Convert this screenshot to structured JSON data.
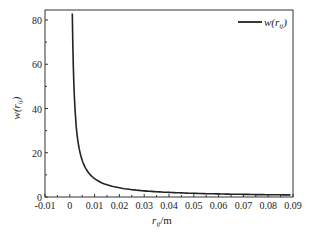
{
  "chart_data": {
    "type": "line",
    "title": "",
    "xlabel": "r_ij/m",
    "ylabel": "w(r_ij)",
    "xlim": [
      -0.01,
      0.09
    ],
    "ylim": [
      0,
      85
    ],
    "xticks": [
      "-0.01",
      "0",
      "0.01",
      "0.02",
      "0.03",
      "0.04",
      "0.05",
      "0.06",
      "0.07",
      "0.08",
      "0.09"
    ],
    "yticks": [
      "0",
      "20",
      "40",
      "60",
      "80"
    ],
    "grid": false,
    "legend_position": "upper right",
    "series": [
      {
        "name": "w(r_ij)",
        "color": "#222222",
        "x": [
          0.001,
          0.0015,
          0.002,
          0.003,
          0.004,
          0.005,
          0.006,
          0.008,
          0.01,
          0.015,
          0.02,
          0.03,
          0.04,
          0.05,
          0.06,
          0.07,
          0.08,
          0.09
        ],
        "y": [
          83,
          55.3,
          41.5,
          27.7,
          20.8,
          16.6,
          13.8,
          10.4,
          8.3,
          5.5,
          4.2,
          2.8,
          2.1,
          1.7,
          1.4,
          1.2,
          1.0,
          0.9
        ]
      }
    ]
  },
  "labels": {
    "xlabel_main": "r",
    "xlabel_sub": "ij",
    "xlabel_unit": "/m",
    "ylabel_main": "w(r",
    "ylabel_sub": "ij",
    "ylabel_close": ")",
    "legend_main": "w(r",
    "legend_sub": "ij",
    "legend_close": ")"
  }
}
